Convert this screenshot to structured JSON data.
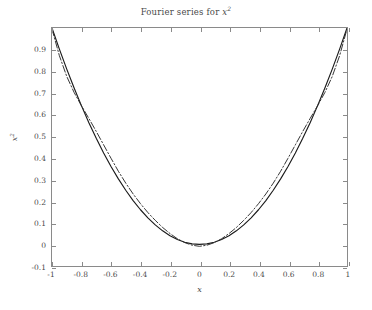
{
  "chart_data": {
    "type": "line",
    "title_base": "Fourier series for ",
    "title_var": "x",
    "title_exp": "2",
    "xlabel": "x",
    "ylabel_var": "x",
    "ylabel_exp": "2",
    "xlim": [
      -1,
      1
    ],
    "ylim": [
      -0.1,
      1.0
    ],
    "grid": false,
    "legend": null,
    "xticks": [
      -1,
      -0.8,
      -0.6,
      -0.4,
      -0.2,
      0,
      0.2,
      0.4,
      0.6,
      0.8,
      1
    ],
    "xtick_labels": [
      "-1",
      "-0.8",
      "-0.6",
      "-0.4",
      "-0.2",
      "0",
      "0.2",
      "0.4",
      "0.6",
      "0.8",
      "1"
    ],
    "yticks": [
      -0.1,
      0,
      0.1,
      0.2,
      0.3,
      0.4,
      0.5,
      0.6,
      0.7,
      0.8,
      0.9
    ],
    "ytick_labels": [
      "-0.1",
      "0",
      "0.1",
      "0.2",
      "0.3",
      "0.4",
      "0.5",
      "0.6",
      "0.7",
      "0.8",
      "0.9"
    ],
    "axis_color": "#8a8a8a",
    "series": [
      {
        "name": "x^2",
        "style": "solid",
        "color": "#1a1a1a",
        "x": [
          -1,
          -0.95,
          -0.9,
          -0.85,
          -0.8,
          -0.75,
          -0.7,
          -0.65,
          -0.6,
          -0.55,
          -0.5,
          -0.45,
          -0.4,
          -0.35,
          -0.3,
          -0.25,
          -0.2,
          -0.15,
          -0.1,
          -0.05,
          0,
          0.05,
          0.1,
          0.15,
          0.2,
          0.25,
          0.3,
          0.35,
          0.4,
          0.45,
          0.5,
          0.55,
          0.6,
          0.65,
          0.7,
          0.75,
          0.8,
          0.85,
          0.9,
          0.95,
          1
        ],
        "y": [
          1,
          0.9025,
          0.81,
          0.7225,
          0.64,
          0.5625,
          0.49,
          0.4225,
          0.36,
          0.3025,
          0.25,
          0.2025,
          0.16,
          0.1225,
          0.09,
          0.0625,
          0.04,
          0.0225,
          0.01,
          0.0025,
          0,
          0.0025,
          0.01,
          0.0225,
          0.04,
          0.0625,
          0.09,
          0.1225,
          0.16,
          0.2025,
          0.25,
          0.3025,
          0.36,
          0.4225,
          0.49,
          0.5625,
          0.64,
          0.7225,
          0.81,
          0.9025,
          1
        ]
      },
      {
        "name": "Fourier partial sum",
        "style": "dashdot",
        "color": "#2a2a2a",
        "x": [
          -1,
          -0.95,
          -0.9,
          -0.85,
          -0.8,
          -0.75,
          -0.7,
          -0.65,
          -0.6,
          -0.55,
          -0.5,
          -0.45,
          -0.4,
          -0.35,
          -0.3,
          -0.25,
          -0.2,
          -0.15,
          -0.1,
          -0.05,
          0,
          0.05,
          0.1,
          0.15,
          0.2,
          0.25,
          0.3,
          0.35,
          0.4,
          0.45,
          0.5,
          0.55,
          0.6,
          0.65,
          0.7,
          0.75,
          0.8,
          0.85,
          0.9,
          0.95,
          1
        ],
        "y": [
          0.995,
          0.872,
          0.776,
          0.702,
          0.64,
          0.582,
          0.522,
          0.46,
          0.398,
          0.338,
          0.283,
          0.233,
          0.188,
          0.147,
          0.111,
          0.078,
          0.05,
          0.026,
          0.008,
          -0.004,
          -0.009,
          -0.004,
          0.008,
          0.026,
          0.05,
          0.078,
          0.111,
          0.147,
          0.188,
          0.233,
          0.283,
          0.338,
          0.398,
          0.46,
          0.522,
          0.582,
          0.64,
          0.702,
          0.776,
          0.872,
          0.995
        ]
      }
    ]
  }
}
